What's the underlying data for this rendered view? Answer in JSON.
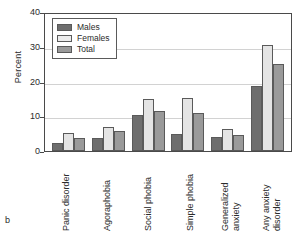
{
  "panel_letter": "b",
  "legend": {
    "position": "top-left-inside",
    "entries": [
      {
        "label": "Males",
        "color": "#6e6e6e"
      },
      {
        "label": "Females",
        "color": "#ececec"
      },
      {
        "label": "Total",
        "color": "#9a9a9a"
      }
    ]
  },
  "axis": {
    "ylabel": "Percent",
    "yticks": [
      "0",
      "10",
      "20",
      "30",
      "40"
    ]
  },
  "categories_lines": [
    {
      "line1": "Panic disorder",
      "line2": ""
    },
    {
      "line1": "Agoraphobia",
      "line2": ""
    },
    {
      "line1": "Social phobia",
      "line2": ""
    },
    {
      "line1": "Simple phobia",
      "line2": ""
    },
    {
      "line1": "Generalized",
      "line2": "anxiety"
    },
    {
      "line1": "Any anxiety",
      "line2": "disorder"
    }
  ],
  "chart_data": {
    "type": "bar",
    "title": "",
    "xlabel": "",
    "ylabel": "Percent",
    "ylim": [
      0,
      40
    ],
    "yticks": [
      0,
      10,
      20,
      30,
      40
    ],
    "grid": true,
    "legend_position": "upper left",
    "categories": [
      "Panic disorder",
      "Agoraphobia",
      "Social phobia",
      "Simple phobia",
      "Generalized anxiety",
      "Any anxiety disorder"
    ],
    "series": [
      {
        "name": "Males",
        "color": "#6e6e6e",
        "values": [
          2.3,
          3.7,
          10.4,
          4.8,
          3.9,
          18.8
        ]
      },
      {
        "name": "Females",
        "color": "#e4e4e4",
        "values": [
          5.3,
          6.8,
          15.1,
          15.4,
          6.3,
          30.5
        ]
      },
      {
        "name": "Total",
        "color": "#9a9a9a",
        "values": [
          3.7,
          5.8,
          11.6,
          10.8,
          4.6,
          25.0
        ]
      }
    ]
  }
}
